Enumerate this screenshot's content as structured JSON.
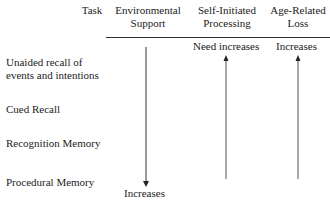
{
  "headers": {
    "task": "Task",
    "environmental_support": [
      "Environmental",
      "Support"
    ],
    "self_initiated": [
      "Self-Initiated",
      "Processing"
    ],
    "age_related": [
      "Age-Related",
      "Loss"
    ]
  },
  "tasks": [
    [
      "Unaided recall of",
      "events and intentions"
    ],
    "Cued Recall",
    "Recognition Memory",
    "Procedural Memory"
  ],
  "arrows": {
    "environmental_support": {
      "direction": "down",
      "label": "Increases"
    },
    "self_initiated": {
      "direction": "up",
      "label": "Need increases"
    },
    "age_related": {
      "direction": "up",
      "label": "Increases"
    }
  },
  "colors": {
    "line": "#333333",
    "text": "#222222"
  }
}
